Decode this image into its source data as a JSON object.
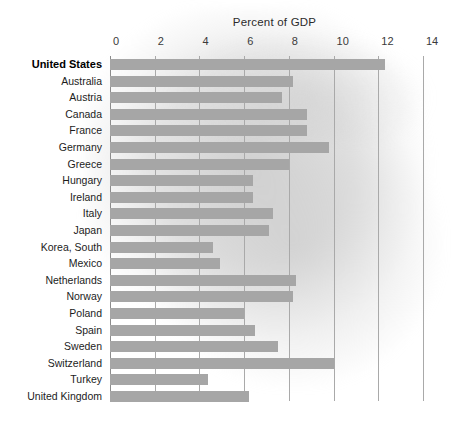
{
  "chart": {
    "title": "Percent of GDP",
    "bar_color": "#a6a6a6",
    "grid_color": "#a9a9a9",
    "axis_color": "#8c8c8c",
    "background": "#ffffff",
    "highlight_country": "United States"
  },
  "chart_data": {
    "type": "bar",
    "orientation": "horizontal",
    "title": "Percent of GDP",
    "xlabel": "Percent of GDP",
    "ylabel": "",
    "xlim": [
      0,
      14
    ],
    "xticks": [
      0,
      2,
      4,
      6,
      8,
      10,
      12,
      14
    ],
    "xtick_labels": [
      "0",
      "2",
      "4",
      "6",
      "8",
      "10",
      "12",
      "14"
    ],
    "grid": true,
    "legend": null,
    "categories": [
      "United States",
      "Australia",
      "Austria",
      "Canada",
      "France",
      "Germany",
      "Greece",
      "Hungary",
      "Ireland",
      "Italy",
      "Japan",
      "Korea, South",
      "Mexico",
      "Netherlands",
      "Norway",
      "Poland",
      "Spain",
      "Sweden",
      "Switzerland",
      "Turkey",
      "United Kingdom"
    ],
    "values": [
      12.3,
      8.2,
      7.7,
      8.8,
      8.8,
      9.8,
      8.0,
      6.4,
      6.4,
      7.3,
      7.1,
      4.6,
      4.9,
      8.3,
      8.2,
      6.0,
      6.5,
      7.5,
      10.0,
      4.4,
      6.2
    ]
  }
}
